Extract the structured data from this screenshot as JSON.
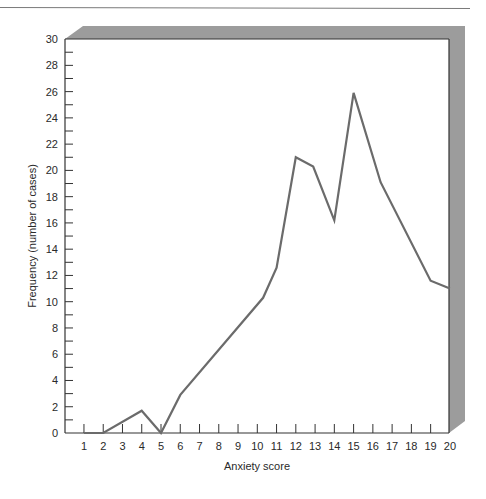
{
  "chart_data": {
    "type": "line",
    "title": "",
    "xlabel": "Anxiety score",
    "ylabel": "Frequency (number of cases)",
    "xlim": [
      0,
      20
    ],
    "ylim": [
      0,
      30
    ],
    "x_ticks": [
      1,
      2,
      3,
      4,
      5,
      6,
      7,
      8,
      9,
      10,
      11,
      12,
      13,
      14,
      15,
      16,
      17,
      18,
      19,
      20
    ],
    "y_ticks_labeled": [
      0,
      2,
      4,
      6,
      8,
      10,
      12,
      14,
      16,
      18,
      20,
      22,
      24,
      26,
      28,
      30
    ],
    "y_minor_ticks": [
      1,
      3,
      5,
      7,
      9,
      11,
      13,
      15,
      17,
      19,
      21,
      23,
      25,
      27,
      29
    ],
    "grid": false,
    "legend": null,
    "series": [
      {
        "name": "Frequency",
        "color": "#6b6b6b",
        "x": [
          1,
          2,
          4,
          5,
          6,
          10.3,
          11,
          12,
          12.9,
          14,
          15,
          16.4,
          19,
          20
        ],
        "values": [
          0,
          0,
          1.7,
          0,
          2.9,
          10.3,
          12.6,
          21,
          20.3,
          16.2,
          25.9,
          19.1,
          11.6,
          11.0
        ]
      }
    ]
  },
  "colors": {
    "line": "#6b6b6b",
    "axis": "#333333",
    "shadow": "#9c9c9c",
    "rule": "#7a7a7a"
  }
}
